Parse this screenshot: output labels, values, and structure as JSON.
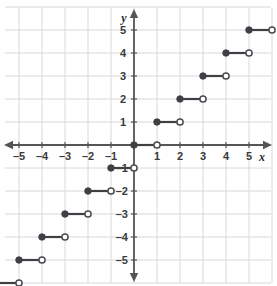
{
  "chart_data": {
    "type": "line",
    "title": "",
    "subtitle": "",
    "xlabel": "x",
    "ylabel": "y",
    "xlim": [
      -6.2,
      6.2
    ],
    "ylim": [
      -6.4,
      5.9
    ],
    "grid": true,
    "grid_step": 1,
    "legend": "none",
    "xticks": [
      -5,
      -4,
      -3,
      -2,
      -1,
      1,
      2,
      3,
      4,
      5
    ],
    "xtick_labels": [
      "–5",
      "–4",
      "–3",
      "–2",
      "–1",
      "1",
      "2",
      "3",
      "4",
      "5"
    ],
    "yticks": [
      5,
      4,
      3,
      2,
      1,
      -1,
      -2,
      -3,
      -4,
      -5
    ],
    "ytick_labels": [
      "5",
      "4",
      "3",
      "2",
      "1",
      "–1",
      "–2",
      "–3",
      "–4",
      "–5"
    ],
    "series": [
      {
        "name": "floor(x)",
        "style": "step-segments",
        "segments": [
          {
            "y": 5,
            "x_start": 5,
            "x_end": 6,
            "left_endpoint": "closed",
            "right_endpoint": "open"
          },
          {
            "y": 4,
            "x_start": 4,
            "x_end": 5,
            "left_endpoint": "closed",
            "right_endpoint": "open"
          },
          {
            "y": 3,
            "x_start": 3,
            "x_end": 4,
            "left_endpoint": "closed",
            "right_endpoint": "open"
          },
          {
            "y": 2,
            "x_start": 2,
            "x_end": 3,
            "left_endpoint": "closed",
            "right_endpoint": "open"
          },
          {
            "y": 1,
            "x_start": 1,
            "x_end": 2,
            "left_endpoint": "closed",
            "right_endpoint": "open"
          },
          {
            "y": 0,
            "x_start": 0,
            "x_end": 1,
            "left_endpoint": "closed",
            "right_endpoint": "open"
          },
          {
            "y": -1,
            "x_start": -1,
            "x_end": 0,
            "left_endpoint": "closed",
            "right_endpoint": "open"
          },
          {
            "y": -2,
            "x_start": -2,
            "x_end": -1,
            "left_endpoint": "closed",
            "right_endpoint": "open"
          },
          {
            "y": -3,
            "x_start": -3,
            "x_end": -2,
            "left_endpoint": "closed",
            "right_endpoint": "open"
          },
          {
            "y": -4,
            "x_start": -4,
            "x_end": -3,
            "left_endpoint": "closed",
            "right_endpoint": "open"
          },
          {
            "y": -5,
            "x_start": -5,
            "x_end": -4,
            "left_endpoint": "closed",
            "right_endpoint": "open"
          },
          {
            "y": -6,
            "x_start": -6,
            "x_end": -5,
            "left_endpoint": "closed",
            "right_endpoint": "open"
          }
        ]
      }
    ],
    "colors": {
      "background": "#ffffff",
      "grid": "#d8d8dc",
      "axis": "#555555",
      "curve": "#3f3f44",
      "closed_point_fill": "#3f3f44",
      "open_point_fill": "#ffffff",
      "open_point_stroke": "#4a4a50",
      "tick_label": "#3a3a3a"
    },
    "axis_arrows": {
      "x_left": true,
      "x_right": true,
      "y_top": true,
      "y_bottom": true
    }
  }
}
